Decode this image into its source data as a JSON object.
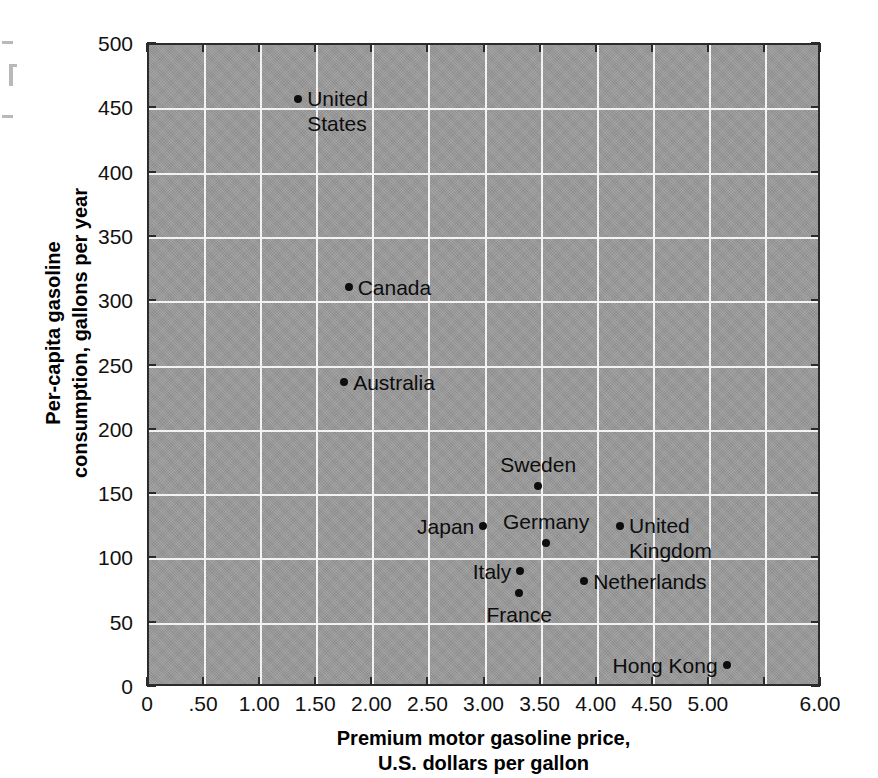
{
  "chart_data": {
    "type": "scatter",
    "title": "",
    "xlabel": "Premium motor gasoline price,\nU.S. dollars per gallon",
    "xlabel_line1": "Premium motor gasoline price,",
    "xlabel_line2": "U.S. dollars per gallon",
    "ylabel": "Per-capita gasoline consumption, gallons per year",
    "ylabel_line1": "Per-capita gasoline",
    "ylabel_line2": "consumption, gallons per year",
    "xlim": [
      0,
      6.0
    ],
    "ylim": [
      0,
      500
    ],
    "xticks": [
      0,
      0.5,
      1.0,
      1.5,
      2.0,
      2.5,
      3.0,
      3.5,
      4.0,
      4.5,
      5.0,
      5.5,
      6.0
    ],
    "xticklabels": [
      "0",
      ".50",
      "1.00",
      "1.50",
      "2.00",
      "2.50",
      "3.00",
      "3.50",
      "4.00",
      "4.50",
      "5.00",
      "",
      "6.00"
    ],
    "yticks": [
      0,
      50,
      100,
      150,
      200,
      250,
      300,
      350,
      400,
      450,
      500
    ],
    "yticklabels": [
      "0",
      "50",
      "100",
      "150",
      "200",
      "250",
      "300",
      "350",
      "400",
      "450",
      "500"
    ],
    "grid": true,
    "grid_color": "#f2f2f2",
    "plot_background": "#9b9b9b",
    "marker_color": "#0d0d0d",
    "legend": "none",
    "points": [
      {
        "label": "United\nStates",
        "label_line1": "United",
        "label_line2": "States",
        "x": 1.33,
        "y": 458,
        "label_pos": "right"
      },
      {
        "label": "Canada",
        "x": 1.78,
        "y": 312,
        "label_pos": "right"
      },
      {
        "label": "Australia",
        "x": 1.74,
        "y": 238,
        "label_pos": "right"
      },
      {
        "label": "Sweden",
        "x": 3.47,
        "y": 157,
        "label_pos": "above"
      },
      {
        "label": "Japan",
        "x": 2.98,
        "y": 126,
        "label_pos": "left"
      },
      {
        "label": "United\nKingdom",
        "label_line1": "United",
        "label_line2": "Kingdom",
        "x": 4.2,
        "y": 126,
        "label_pos": "right"
      },
      {
        "label": "Germany",
        "x": 3.54,
        "y": 113,
        "label_pos": "above"
      },
      {
        "label": "Italy",
        "x": 3.31,
        "y": 91,
        "label_pos": "left"
      },
      {
        "label": "Netherlands",
        "x": 3.88,
        "y": 83,
        "label_pos": "right"
      },
      {
        "label": "France",
        "x": 3.3,
        "y": 74,
        "label_pos": "below"
      },
      {
        "label": "Hong Kong",
        "x": 5.15,
        "y": 18,
        "label_pos": "left"
      }
    ]
  }
}
